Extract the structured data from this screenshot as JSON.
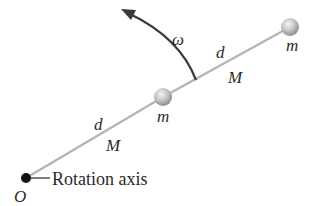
{
  "diagram": {
    "labels": {
      "omega": "ω",
      "d_upper": "d",
      "M_upper": "M",
      "m_end": "m",
      "m_middle": "m",
      "d_lower": "d",
      "M_lower": "M",
      "axis_label": "Rotation axis",
      "origin": "O"
    },
    "colors": {
      "rod": "#b5b5b5",
      "ball": "#c8c8c8",
      "pivot": "#111111",
      "arrow": "#3a3a3a",
      "text": "#2a2a2a"
    }
  }
}
